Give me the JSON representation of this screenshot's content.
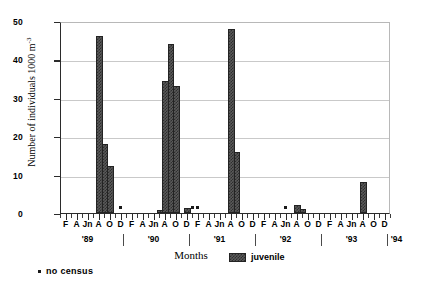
{
  "chart_data": {
    "type": "bar",
    "title": "Coris julis",
    "xlabel": "Months",
    "ylabel": "Number of individuals 1000 m",
    "ylabel_exponent": "-3",
    "ylim": [
      0,
      50
    ],
    "yticks": [
      0,
      10,
      20,
      30,
      40,
      50
    ],
    "grid": true,
    "legend_position": "bottom-right",
    "legend": [
      {
        "name": "juvenile"
      }
    ],
    "footnote": "no census",
    "x_axis": {
      "unit": "month",
      "month_labels": [
        "F",
        "A",
        "Jn",
        "A",
        "O",
        "D"
      ],
      "month_label_indices": [
        1,
        3,
        5,
        7,
        9,
        11
      ],
      "years": [
        "'89",
        "'90",
        "'91",
        "'92",
        "'93",
        "'94"
      ],
      "year_start_index": 0,
      "months_per_year": 12,
      "total_months": 61
    },
    "series": [
      {
        "name": "juvenile",
        "points": [
          {
            "year": "'89",
            "month": 7,
            "month_label": "A",
            "value": 46.0
          },
          {
            "year": "'89",
            "month": 8,
            "month_label": "S",
            "value": 18.0
          },
          {
            "year": "'89",
            "month": 9,
            "month_label": "O",
            "value": 12.2
          },
          {
            "year": "'90",
            "month": 6,
            "month_label": "Jl",
            "value": 0.7
          },
          {
            "year": "'90",
            "month": 7,
            "month_label": "A",
            "value": 34.4
          },
          {
            "year": "'90",
            "month": 8,
            "month_label": "S",
            "value": 44.0
          },
          {
            "year": "'90",
            "month": 9,
            "month_label": "O",
            "value": 33.0
          },
          {
            "year": "'90",
            "month": 11,
            "month_label": "D",
            "value": 1.3
          },
          {
            "year": "'91",
            "month": 7,
            "month_label": "A",
            "value": 48.0
          },
          {
            "year": "'91",
            "month": 8,
            "month_label": "S",
            "value": 16.0
          },
          {
            "year": "'92",
            "month": 7,
            "month_label": "A",
            "value": 2.0
          },
          {
            "year": "'92",
            "month": 8,
            "month_label": "S",
            "value": 1.0
          },
          {
            "year": "'93",
            "month": 7,
            "month_label": "A",
            "value": 8.0
          }
        ]
      }
    ],
    "no_census_markers": [
      {
        "year": "'89",
        "month": 11,
        "month_label": "D",
        "value": 1.6
      },
      {
        "year": "'90",
        "month": 12,
        "month_label": "J",
        "value": 1.6
      },
      {
        "year": "'91",
        "month": 1,
        "month_label": "F",
        "value": 1.6
      },
      {
        "year": "'92",
        "month": 5,
        "month_label": "Jn",
        "value": 1.6
      }
    ]
  }
}
